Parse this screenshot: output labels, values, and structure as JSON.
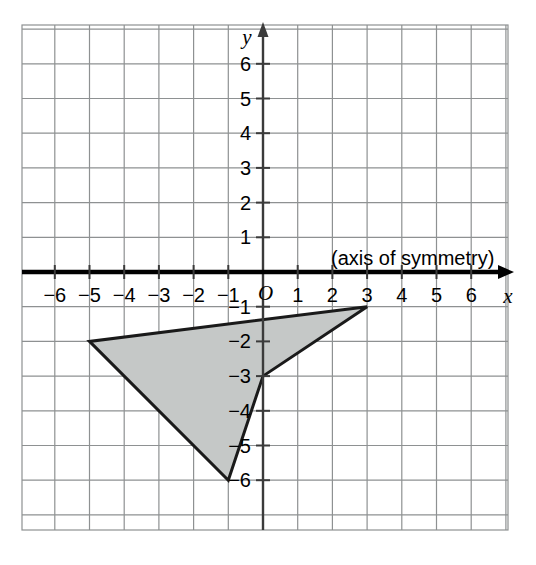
{
  "figure": {
    "background_color": "#ffffff",
    "annotation": {
      "text": "(axis of symmetry)",
      "anchor": "above-x-axis-right"
    },
    "origin_label": "O",
    "x_axis_name": "x",
    "y_axis_name": "y"
  },
  "chart_data": {
    "type": "scatter",
    "title": "",
    "subtitle": "",
    "xlabel": "x",
    "ylabel": "y",
    "xlim": [
      -7,
      7
    ],
    "ylim": [
      -7,
      7
    ],
    "grid": true,
    "grid_spacing": 1,
    "legend": null,
    "x_ticks": [
      -6,
      -5,
      -4,
      -3,
      -2,
      -1,
      1,
      2,
      3,
      4,
      5,
      6
    ],
    "y_ticks": [
      6,
      5,
      4,
      3,
      2,
      1,
      -1,
      -2,
      -3,
      -4,
      -5,
      -6
    ],
    "x_tick_labels": [
      "−6",
      "−5",
      "−4",
      "−3",
      "−2",
      "−1",
      "1",
      "2",
      "3",
      "4",
      "5",
      "6"
    ],
    "y_tick_labels": [
      "6",
      "5",
      "4",
      "3",
      "2",
      "1",
      "−1",
      "−2",
      "−3",
      "−4",
      "−5",
      "−6"
    ],
    "origin_label": "O",
    "annotations": [
      {
        "text": "(axis of symmetry)",
        "x": 1.2,
        "y": 0.5,
        "refers_to": "x-axis"
      }
    ],
    "shapes": [
      {
        "name": "shaded-dart-polygon",
        "kind": "polygon",
        "closed": true,
        "vertices": [
          [
            -5,
            -2
          ],
          [
            -1,
            -6
          ],
          [
            0,
            -3
          ],
          [
            3,
            -1
          ]
        ],
        "fill": "#c5c8c7",
        "stroke": "#1a1a1a",
        "stroke_width": 3
      }
    ],
    "emphasized_axis": {
      "axis": "x",
      "role": "axis of symmetry",
      "stroke": "#000000",
      "stroke_width": 4
    },
    "colors": {
      "shape_fill": "#c5c8c7",
      "shape_stroke": "#1a1a1a",
      "grid_line": "#8e9192",
      "axis_line": "#000000",
      "text": "#000000"
    }
  },
  "geometry": {
    "origin_px": [
      263,
      272
    ],
    "unit_px": 34.7,
    "grid_left_px": 22,
    "grid_top_px": 25,
    "grid_right_px": 508,
    "grid_bottom_px": 530
  }
}
